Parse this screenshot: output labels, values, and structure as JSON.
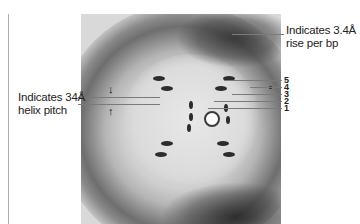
{
  "figure": {
    "annotations": {
      "helix_pitch": {
        "line1": "Indicates 34Å",
        "line2": "helix pitch"
      },
      "rise_per_bp": {
        "line1": "Indicates 3.4Å",
        "line2": "rise per bp"
      },
      "layer_lines": [
        "5",
        "4",
        "3",
        "2",
        "1"
      ],
      "arrows": {
        "down": "↓",
        "up": "↑"
      }
    }
  },
  "colors": {
    "background": "#ffffff",
    "text": "#222222",
    "leader_lines": "#7a7a7a",
    "photo_dark": "#2c2c2c",
    "photo_light": "#e2e2e2"
  }
}
